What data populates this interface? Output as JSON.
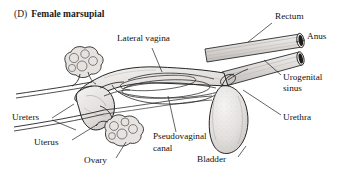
{
  "figure": {
    "panel_letter": "(D)",
    "title": "Female marsupial",
    "type": "anatomical-line-drawing",
    "background_color": "#ffffff",
    "ink_color": "#1a1a1a",
    "organ_fill_color": "#e8e6e4",
    "shade_color": "#cfcccb",
    "labels": [
      {
        "id": "lateral-vagina",
        "text": "Lateral vagina",
        "x": 117,
        "y": 38,
        "align": "left"
      },
      {
        "id": "rectum",
        "text": "Rectum",
        "x": 275,
        "y": 16,
        "align": "left"
      },
      {
        "id": "anus",
        "text": "Anus",
        "x": 307,
        "y": 36,
        "align": "left"
      },
      {
        "id": "urogenital-sinus-1",
        "text": "Urogenital",
        "x": 283,
        "y": 77,
        "align": "left"
      },
      {
        "id": "urogenital-sinus-2",
        "text": "sinus",
        "x": 283,
        "y": 88,
        "align": "left"
      },
      {
        "id": "urethra",
        "text": "Urethra",
        "x": 283,
        "y": 117,
        "align": "left"
      },
      {
        "id": "ureters",
        "text": "Ureters",
        "x": 12,
        "y": 117,
        "align": "left"
      },
      {
        "id": "uterus",
        "text": "Uterus",
        "x": 34,
        "y": 142,
        "align": "left"
      },
      {
        "id": "ovary",
        "text": "Ovary",
        "x": 84,
        "y": 160,
        "align": "left"
      },
      {
        "id": "pseudovaginal-1",
        "text": "Pseudovaginal",
        "x": 153,
        "y": 136,
        "align": "left"
      },
      {
        "id": "pseudovaginal-2",
        "text": "canal",
        "x": 153,
        "y": 148,
        "align": "left"
      },
      {
        "id": "bladder",
        "text": "Bladder",
        "x": 197,
        "y": 159,
        "align": "left"
      }
    ]
  }
}
